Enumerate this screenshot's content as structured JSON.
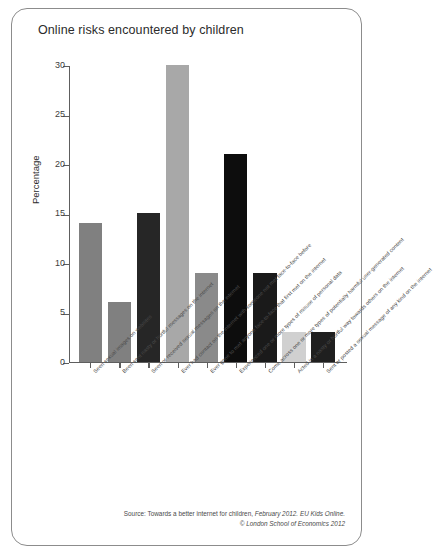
{
  "card": {
    "title": "Online risks encountered by children"
  },
  "source": {
    "line1_prefix": "Source: Towards a better internet for children,",
    "line1_em": "February 2012. EU Kids Online.",
    "line2_em": "© London School of Economics 2012"
  },
  "colors": {
    "border": "#8c8c8c",
    "axis": "#5e5e5e",
    "text": "#2b2b2b",
    "bar_gray": "#808080",
    "bar_black": "#0d0d0d",
    "bar_lightgray": "#b5b5b5",
    "bar_lightest": "#d0d0d0",
    "background": "#ffffff"
  },
  "chart_data": {
    "type": "bar",
    "title": "Online risks encountered by children",
    "xlabel": "",
    "ylabel": "Percentage",
    "ylim": [
      0,
      30
    ],
    "yticks": [
      0,
      5,
      10,
      15,
      20,
      25,
      30
    ],
    "grid": false,
    "legend": "none",
    "categories": [
      "Seen sexual images on websites",
      "Been sent nasty or hurtful messages on the internet",
      "Seen or received sexual messages on the internet",
      "Ever had contact on the internet with someone not met face-to-face before",
      "Ever gone to met anyone face-to-face that first met on the internet",
      "Experienced one or more types of misuse of personal data",
      "Come across one or more types of potentially harmful user-generated content",
      "Acted in a nasty or hurtful way towards others on the internet",
      "Sent or posted a sexual message of any kind on the internet"
    ],
    "values": [
      14,
      6,
      15,
      30,
      9,
      21,
      9,
      3,
      3
    ],
    "bar_colors": [
      "#808080",
      "#808080",
      "#262626",
      "#a8a8a8",
      "#8a8a8a",
      "#0d0d0d",
      "#1a1a1a",
      "#d0d0d0",
      "#1f1f1f"
    ]
  }
}
